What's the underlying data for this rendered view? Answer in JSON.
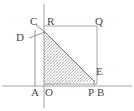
{
  "figure": {
    "background_color": "#ffffff",
    "stroke_color": "#8a8a8a",
    "axis_color": "#9a9a9a",
    "label_color": "#4a4a4a",
    "hatch_color": "#9a9a9a",
    "width": 134,
    "height": 111
  },
  "axes": {
    "x_axis": {
      "name": "x-axis",
      "x1": 2,
      "y1": 86,
      "x2": 132,
      "y2": 86
    },
    "y_axis": {
      "name": "y-axis",
      "x1": 44,
      "y1": 4,
      "x2": 44,
      "y2": 108
    }
  },
  "points": {
    "A": {
      "label": "A",
      "x": 35,
      "y": 86,
      "label_x": 31,
      "label_y": 87
    },
    "O": {
      "label": "O",
      "x": 44,
      "y": 86,
      "label_x": 45,
      "label_y": 87
    },
    "P": {
      "label": "P",
      "x": 94,
      "y": 86,
      "label_x": 88,
      "label_y": 87
    },
    "B": {
      "label": "B",
      "x": 101,
      "y": 86,
      "label_x": 97,
      "label_y": 87
    },
    "C": {
      "label": "C",
      "x": 39,
      "y": 28,
      "label_x": 30,
      "label_y": 16
    },
    "D": {
      "label": "D",
      "x": 35,
      "y": 39,
      "label_x": 16,
      "label_y": 32
    },
    "R": {
      "label": "R",
      "x": 44,
      "y": 26,
      "label_x": 47,
      "label_y": 16
    },
    "Q": {
      "label": "Q",
      "x": 97,
      "y": 26,
      "label_x": 95,
      "label_y": 16
    },
    "E": {
      "label": "E",
      "x": 94,
      "y": 80,
      "label_x": 96,
      "label_y": 66
    },
    "apex": {
      "label": "",
      "x": 44,
      "y": 31
    }
  },
  "shapes": {
    "rectangle": {
      "name": "rectangle-RQ",
      "points": "44,26 97,26 97,84 44,84"
    },
    "shaded_triangle": {
      "name": "shaded-right-triangle",
      "points": "44,31 94,81 44,86",
      "fill": "hatch"
    },
    "vertical_segment_A": {
      "name": "segment-A-C",
      "x1": 35,
      "y1": 30,
      "x2": 35,
      "y2": 86
    },
    "segment_C_apex": {
      "name": "segment-C-apex",
      "x1": 36,
      "y1": 25,
      "x2": 45,
      "y2": 32
    },
    "segment_D_apex": {
      "name": "segment-D-apex",
      "x1": 30,
      "y1": 38,
      "x2": 45,
      "y2": 32
    },
    "hypotenuse": {
      "name": "hypotenuse-apex-E",
      "x1": 44,
      "y1": 31,
      "x2": 95,
      "y2": 82
    },
    "segment_E_P": {
      "name": "segment-E-P",
      "x1": 94,
      "y1": 80,
      "x2": 94,
      "y2": 86
    }
  }
}
